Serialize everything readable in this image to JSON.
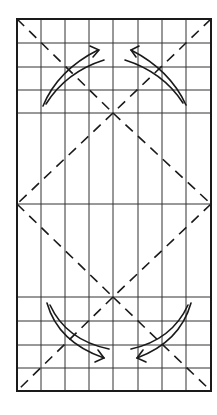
{
  "diagram": {
    "type": "origami-fold-diagram",
    "colors": {
      "ink": "#1a1a1a",
      "grid": "#333333",
      "background": "#ffffff"
    },
    "frame": {
      "x": 17,
      "y": 19,
      "width": 194,
      "height": 372
    },
    "grid": {
      "columns_x": [
        41,
        65,
        89,
        113,
        138,
        162,
        186
      ],
      "top_rows_y": [
        43,
        67,
        90,
        113
      ],
      "middle_row_y": 204,
      "bottom_rows_y": [
        297,
        321,
        345,
        368
      ]
    },
    "fold_lines": {
      "style": "dashed",
      "segments": [
        {
          "name": "diag-top-left",
          "x1": 17,
          "y1": 19,
          "x2": 113,
          "y2": 113
        },
        {
          "name": "diag-top-right",
          "x1": 211,
          "y1": 19,
          "x2": 113,
          "y2": 113
        },
        {
          "name": "diamond-upper-left",
          "x1": 113,
          "y1": 113,
          "x2": 17,
          "y2": 204
        },
        {
          "name": "diamond-upper-right",
          "x1": 113,
          "y1": 113,
          "x2": 211,
          "y2": 204
        },
        {
          "name": "diamond-lower-left",
          "x1": 17,
          "y1": 204,
          "x2": 113,
          "y2": 297
        },
        {
          "name": "diamond-lower-right",
          "x1": 211,
          "y1": 204,
          "x2": 113,
          "y2": 297
        },
        {
          "name": "diag-bottom-left",
          "x1": 113,
          "y1": 297,
          "x2": 17,
          "y2": 391
        },
        {
          "name": "diag-bottom-right",
          "x1": 113,
          "y1": 297,
          "x2": 211,
          "y2": 391
        }
      ]
    },
    "arrows": [
      {
        "name": "fold-arrow-top-left",
        "direction": "up-right"
      },
      {
        "name": "fold-arrow-top-right",
        "direction": "up-left"
      },
      {
        "name": "fold-arrow-bottom-left",
        "direction": "down-right"
      },
      {
        "name": "fold-arrow-bottom-right",
        "direction": "down-left"
      }
    ]
  }
}
